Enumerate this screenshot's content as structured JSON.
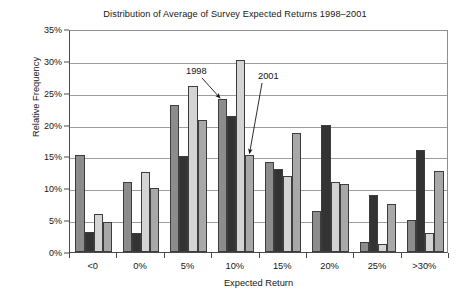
{
  "chart_data": {
    "type": "bar",
    "title": "Distribution of Average of Survey Expected Returns 1998–2001",
    "xlabel": "Expected Return",
    "ylabel": "Relative Frequency",
    "categories": [
      "<0",
      "0%",
      "5%",
      "10%",
      "15%",
      "20%",
      "25%",
      ">30%"
    ],
    "ylim": [
      0,
      35
    ],
    "ytick_labels": [
      "0%",
      "5%",
      "10%",
      "15%",
      "20%",
      "25%",
      "30%",
      "35%"
    ],
    "ytick_values": [
      0,
      5,
      10,
      15,
      20,
      25,
      30,
      35
    ],
    "grid": true,
    "legend": "none",
    "units": "percent",
    "series": [
      {
        "name": "1998",
        "color": "#8c8c8c",
        "values": [
          15.3,
          11.0,
          23.0,
          24.0,
          14.2,
          6.5,
          1.5,
          5.0
        ]
      },
      {
        "name": "1999",
        "color": "#333333",
        "values": [
          3.2,
          3.0,
          15.0,
          21.3,
          13.0,
          20.0,
          9.0,
          16.0
        ]
      },
      {
        "name": "2000",
        "color": "#d4d4d4",
        "values": [
          6.0,
          12.5,
          26.0,
          30.2,
          12.0,
          11.0,
          1.3,
          3.0
        ]
      },
      {
        "name": "2001",
        "color": "#a8a8a8",
        "values": [
          4.7,
          10.0,
          20.7,
          15.3,
          18.7,
          10.7,
          7.5,
          12.7
        ]
      }
    ],
    "annotations": [
      {
        "label": "1998",
        "target_category": "10%",
        "target_series": "1998",
        "target_value": 24.0
      },
      {
        "label": "2001",
        "target_category": "10%",
        "target_series": "2001",
        "target_value": 15.3
      }
    ]
  }
}
